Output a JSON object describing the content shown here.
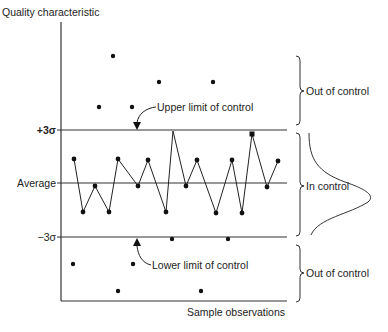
{
  "diagram": {
    "type": "control-chart",
    "y_axis_title": "Quality characteristic",
    "x_axis_title": "Sample observations",
    "y_levels": {
      "ucl_label": "+3σ",
      "center_label": "Average",
      "lcl_label": "−3σ"
    },
    "annotations": {
      "ucl_arrow": "Upper limit of control",
      "lcl_arrow": "Lower limit of control"
    },
    "regions": {
      "upper": "Out of control",
      "middle": "In control",
      "lower": "Out of control"
    },
    "colors": {
      "line": "#222222",
      "axis": "#333333",
      "point": "#111111"
    },
    "in_control_series": [
      [
        74,
        159
      ],
      [
        83,
        212
      ],
      [
        95,
        186
      ],
      [
        109,
        212
      ],
      [
        118,
        159
      ],
      [
        138,
        186
      ],
      [
        148,
        160
      ],
      [
        166,
        212
      ],
      [
        173,
        131
      ],
      [
        186,
        186
      ],
      [
        197,
        160
      ],
      [
        216,
        213
      ],
      [
        232,
        160
      ],
      [
        242,
        213
      ],
      [
        252,
        134
      ],
      [
        267,
        187
      ],
      [
        278,
        161
      ]
    ],
    "out_of_control_points_upper": [
      [
        113,
        56
      ],
      [
        159,
        82
      ],
      [
        213,
        82
      ],
      [
        99,
        107
      ],
      [
        132,
        107
      ]
    ],
    "out_of_control_points_lower": [
      [
        172,
        239
      ],
      [
        228,
        239
      ],
      [
        73,
        264
      ],
      [
        133,
        264
      ],
      [
        118,
        291
      ],
      [
        201,
        291
      ]
    ]
  }
}
